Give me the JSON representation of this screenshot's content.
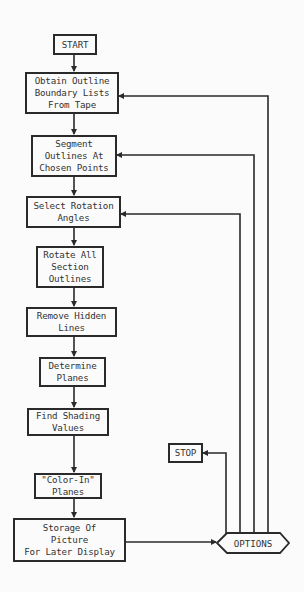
{
  "diagram": {
    "type": "flowchart",
    "nodes": [
      {
        "id": "start",
        "label": "START"
      },
      {
        "id": "obtain",
        "label": "Obtain Outline\nBoundary Lists\nFrom Tape"
      },
      {
        "id": "segment",
        "label": "Segment\nOutlines At\nChosen Points"
      },
      {
        "id": "select",
        "label": "Select Rotation\nAngles"
      },
      {
        "id": "rotate",
        "label": "Rotate All\nSection\nOutlines"
      },
      {
        "id": "remove",
        "label": "Remove Hidden\nLines"
      },
      {
        "id": "determine",
        "label": "Determine\nPlanes"
      },
      {
        "id": "shading",
        "label": "Find Shading\nValues"
      },
      {
        "id": "colorin",
        "label": "\"Color-In\"\nPlanes"
      },
      {
        "id": "storage",
        "label": "Storage Of\nPicture\nFor Later Display"
      },
      {
        "id": "stop",
        "label": "STOP"
      },
      {
        "id": "options",
        "label": "OPTIONS"
      }
    ],
    "edges": [
      {
        "from": "start",
        "to": "obtain"
      },
      {
        "from": "obtain",
        "to": "segment"
      },
      {
        "from": "segment",
        "to": "select"
      },
      {
        "from": "select",
        "to": "rotate"
      },
      {
        "from": "rotate",
        "to": "remove"
      },
      {
        "from": "remove",
        "to": "determine"
      },
      {
        "from": "determine",
        "to": "shading"
      },
      {
        "from": "shading",
        "to": "colorin"
      },
      {
        "from": "colorin",
        "to": "storage"
      },
      {
        "from": "storage",
        "to": "options"
      },
      {
        "from": "options",
        "to": "stop"
      },
      {
        "from": "options",
        "to": "select"
      },
      {
        "from": "options",
        "to": "segment"
      },
      {
        "from": "options",
        "to": "obtain"
      }
    ],
    "line_color": "#2a2a2a",
    "background": "#fbfbfb"
  }
}
